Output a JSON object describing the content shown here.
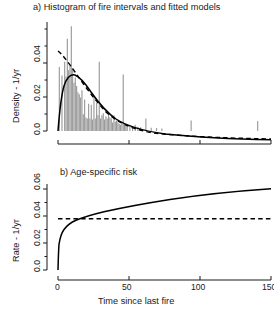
{
  "figure": {
    "width": 274,
    "height": 312,
    "background": "#ffffff",
    "foreground": "#1a1a1a",
    "bar_color": "#9a9a9a",
    "curve_color": "#000000"
  },
  "chart_data": [
    {
      "id": "panel-a",
      "type": "bar",
      "title": "a) Histogram of fire intervals and fitted models",
      "xlabel": "",
      "ylabel": "Density - 1/yr",
      "xlim": [
        0,
        160
      ],
      "ylim": [
        0,
        0.052
      ],
      "grid": false,
      "legend": null,
      "x_tick_labels": [
        "",
        "",
        "",
        ""
      ],
      "x_ticks": [
        0,
        50,
        100,
        150
      ],
      "y_ticks": [
        0.0,
        0.02,
        0.04
      ],
      "y_tick_labels": [
        "0.0",
        "0.02",
        "0.04"
      ],
      "y_minor_ticks": [
        0.01,
        0.03,
        0.05
      ],
      "categories": [
        1,
        3,
        5,
        6,
        7,
        8,
        9,
        10,
        11,
        12,
        13,
        14,
        15,
        16,
        17,
        18,
        19,
        20,
        21,
        22,
        23,
        24,
        25,
        26,
        27,
        28,
        29,
        30,
        31,
        32,
        33,
        34,
        35,
        36,
        37,
        38,
        39,
        40,
        41,
        42,
        43,
        44,
        45,
        46,
        47,
        48,
        49,
        50,
        51,
        52,
        54,
        56,
        58,
        60,
        62,
        66,
        70,
        74,
        78,
        100,
        150
      ],
      "values": [
        0.0305,
        0.0265,
        0.033,
        0.026,
        0.044,
        0.029,
        0.031,
        0.05,
        0.03,
        0.023,
        0.0255,
        0.0215,
        0.0185,
        0.0175,
        0.016,
        0.0195,
        0.008,
        0.015,
        0.0065,
        0.006,
        0.013,
        0.006,
        0.0125,
        0.0055,
        0.0165,
        0.006,
        0.0135,
        0.0075,
        0.033,
        0.006,
        0.0075,
        0.0085,
        0.0055,
        0.007,
        0.006,
        0.008,
        0.0065,
        0.006,
        0.004,
        0.0075,
        0.0045,
        0.005,
        0.004,
        0.0035,
        0.003,
        0.0045,
        0.027,
        0.003,
        0.0028,
        0.0026,
        0.003,
        0.0022,
        0.003,
        0.002,
        0.0018,
        0.006,
        0.0016,
        0.0014,
        0.0012,
        0.005,
        0.0048
      ],
      "series": [
        {
          "name": "fitted model (solid)",
          "style": "solid",
          "description": "peaked then decaying density, peak ~0.029 near t=10"
        },
        {
          "name": "fitted model (dashed)",
          "style": "dashed",
          "description": "monotone decreasing density from ~0.047 at t=0"
        }
      ]
    },
    {
      "id": "panel-b",
      "type": "line",
      "title": "b) Age-specific risk",
      "xlabel": "Time since last fire",
      "ylabel": "Rate - 1/yr",
      "xlim": [
        0,
        160
      ],
      "ylim": [
        0,
        0.065
      ],
      "grid": false,
      "legend": null,
      "x_ticks": [
        0,
        50,
        100,
        150
      ],
      "x_tick_labels": [
        "0",
        "50",
        "100",
        "150"
      ],
      "y_ticks": [
        0.0,
        0.02,
        0.04,
        0.06
      ],
      "y_tick_labels": [
        "0.0",
        "0.02",
        "0.04",
        "0.06"
      ],
      "series": [
        {
          "name": "age-specific hazard",
          "style": "solid",
          "x": [
            0,
            0.5,
            1,
            2,
            3,
            5,
            8,
            12,
            16,
            20,
            30,
            40,
            55,
            70,
            90,
            110,
            130,
            150,
            160
          ],
          "y": [
            0.0,
            0.014,
            0.019,
            0.024,
            0.027,
            0.0305,
            0.0338,
            0.0368,
            0.039,
            0.0407,
            0.044,
            0.0463,
            0.049,
            0.051,
            0.0532,
            0.055,
            0.0565,
            0.0578,
            0.0583
          ]
        },
        {
          "name": "constant rate",
          "style": "dashed",
          "x": [
            0,
            160
          ],
          "y": [
            0.038,
            0.038
          ]
        }
      ],
      "crossing_point": {
        "x": 15,
        "y": 0.038
      }
    }
  ]
}
